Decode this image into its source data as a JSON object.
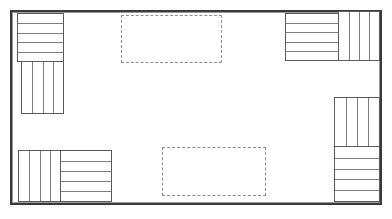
{
  "diagram": {
    "type": "floor-plan",
    "background_color": "#ffffff",
    "frame": {
      "label": "Room Outline",
      "x": 10,
      "y": 10,
      "width": 372,
      "height": 195,
      "border_color": "#3a3a3a",
      "inner_border_color": "#9a9a9a",
      "fill_color": "#ffffff"
    },
    "stripe_color": "#7d7d7d",
    "block_border_color": "#5b5b5b",
    "dashed_color": "#8d8d8d",
    "furniture_groups": [
      {
        "name": "top-left-group",
        "label": "Top Left Seating Cluster",
        "blocks": [
          {
            "name": "top-left-horizontal-block",
            "label": "Bench A",
            "orientation": "horizontal",
            "stripe_count": 5,
            "x": 17,
            "y": 13,
            "width": 47,
            "height": 49
          },
          {
            "name": "top-left-vertical-block",
            "label": "Bench B",
            "orientation": "vertical",
            "stripe_count": 4,
            "x": 21,
            "y": 61,
            "width": 43,
            "height": 53
          }
        ]
      },
      {
        "name": "top-right-group",
        "label": "Top Right Seating Cluster",
        "blocks": [
          {
            "name": "top-right-horizontal-block",
            "label": "Bench C",
            "orientation": "horizontal",
            "stripe_count": 5,
            "x": 285,
            "y": 13,
            "width": 54,
            "height": 48
          },
          {
            "name": "top-right-vertical-block",
            "label": "Bench D",
            "orientation": "vertical",
            "stripe_count": 4,
            "x": 338,
            "y": 11,
            "width": 42,
            "height": 50
          }
        ]
      },
      {
        "name": "bottom-left-group",
        "label": "Bottom Left Seating Cluster",
        "blocks": [
          {
            "name": "bottom-left-vertical-block",
            "label": "Bench E",
            "orientation": "vertical",
            "stripe_count": 4,
            "x": 18,
            "y": 150,
            "width": 43,
            "height": 52
          },
          {
            "name": "bottom-left-horizontal-block",
            "label": "Bench F",
            "orientation": "horizontal",
            "stripe_count": 5,
            "x": 60,
            "y": 150,
            "width": 52,
            "height": 52
          }
        ]
      },
      {
        "name": "bottom-right-group",
        "label": "Bottom Right Seating Cluster",
        "blocks": [
          {
            "name": "bottom-right-vertical-block",
            "label": "Bench G",
            "orientation": "vertical",
            "stripe_count": 4,
            "x": 334,
            "y": 97,
            "width": 46,
            "height": 50
          },
          {
            "name": "bottom-right-horizontal-block",
            "label": "Bench H",
            "orientation": "horizontal",
            "stripe_count": 5,
            "x": 334,
            "y": 146,
            "width": 46,
            "height": 56
          }
        ]
      }
    ],
    "dashed_zones": [
      {
        "name": "upper-dashed-zone",
        "label": "Reserved Area 1",
        "x": 121,
        "y": 15,
        "width": 101,
        "height": 48
      },
      {
        "name": "lower-dashed-zone",
        "label": "Reserved Area 2",
        "x": 162,
        "y": 147,
        "width": 104,
        "height": 49
      }
    ]
  }
}
